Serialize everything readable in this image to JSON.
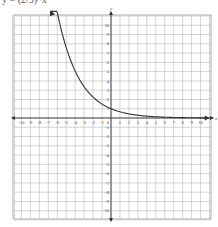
{
  "header_text": "y = (2/3)^x",
  "chart_data": {
    "type": "line",
    "title": "",
    "xlabel": "x",
    "ylabel": "y",
    "xlim": [
      -11,
      11
    ],
    "ylim": [
      -11,
      11
    ],
    "grid": true,
    "x_ticks": [
      -10,
      -9,
      -8,
      -7,
      -6,
      -5,
      -4,
      -3,
      -2,
      -1,
      1,
      2,
      3,
      4,
      5,
      6,
      7,
      8,
      9,
      10
    ],
    "y_ticks": [
      10,
      9,
      8,
      7,
      6,
      5,
      4,
      3,
      2,
      1,
      -1,
      -2,
      -3,
      -4,
      -5,
      -6,
      -7,
      -8,
      -9,
      -10
    ],
    "series": [
      {
        "name": "exponential decay",
        "function": "(2/3)^x",
        "base": 0.6667,
        "x": [
          -6.7,
          -6,
          -5,
          -4,
          -3,
          -2,
          -1,
          0,
          1,
          2,
          3,
          4,
          5,
          6,
          7,
          8,
          9,
          10.8
        ],
        "y": [
          15.1,
          11.4,
          7.59,
          5.06,
          3.38,
          2.25,
          1.5,
          1,
          0.67,
          0.44,
          0.3,
          0.2,
          0.13,
          0.09,
          0.06,
          0.04,
          0.03,
          0.01
        ],
        "arrows": [
          "left",
          "right"
        ],
        "color": "#333333"
      }
    ]
  }
}
